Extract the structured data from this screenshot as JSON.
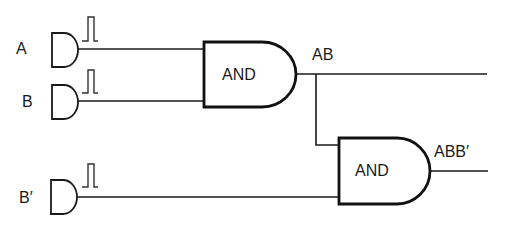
{
  "diagram": {
    "type": "logic-circuit",
    "inputs": [
      {
        "label": "A",
        "signal": "pulse"
      },
      {
        "label": "B",
        "signal": "pulse"
      },
      {
        "label": "B′",
        "signal": "pulse"
      }
    ],
    "gates": [
      {
        "id": "gate1",
        "label": "AND",
        "inputs": [
          "A",
          "B"
        ],
        "output_label": "AB"
      },
      {
        "id": "gate2",
        "label": "AND",
        "inputs": [
          "AB",
          "B′"
        ],
        "output_label": "ABB′"
      }
    ],
    "colors": {
      "line": "#1a1a1a",
      "background": "#ffffff"
    }
  }
}
